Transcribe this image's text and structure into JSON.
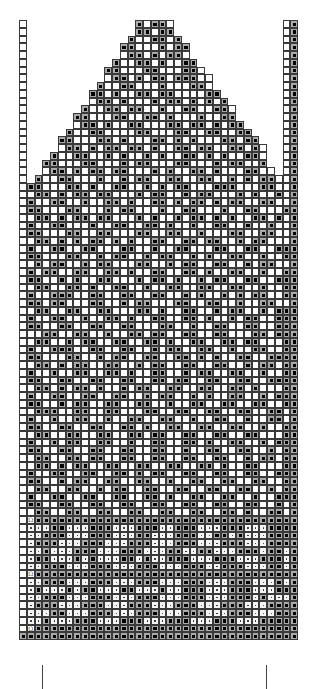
{
  "chart_title": "",
  "legend": {
    "w": "knit stitch (empty)",
    "g": "contrast colour stitch",
    "d": "purl / dot stitch",
    "q": "twisted stitch",
    ".": "no stitch"
  },
  "twist_symbol": "Ω",
  "columns": 36,
  "rows": [
    "w..............gwggw..............wg",
    "w..............ggwgg..............wg",
    "w.............gwwggwg.............wg",
    "w............ggwwwgwgg............wg",
    "w............wggwgwggw............wg",
    "w...........gwwggwgwwgg...........wg",
    "w..........ggwwwggwwwggw..........wg",
    "w..........wggwgwggwgggww.........wg",
    "w.........gwwggwwwgwwwggw.........wg",
    "w........ggwgwwggwggwwwwgg........wg",
    "w........wggwgwwwgwggwgwgwg.......wg",
    "w.......gwwggwggwwgwwggwwggw......wg",
    "w......ggwwwggwwggwgwwwgwwgg......wg",
    "w......wggwgwwggwwwggwggwgwgg.....wg",
    "w.....gwwggwwwwggwwwggwwggwwgg....wg",
    "w....ggwwwggwgwwwggwgwgwwwggwgg...wg",
    "w....wggwgwggwggwgwwggwggwwggwgw..wg",
    "w...gwwggwwgwgwwgwgwwggwgwgwwggw..wg",
    "w..ggwwwggwwwgwggwwwggwwwgwggwwg..wg",
    "w..wggwgwggwggwwwgwgwwggwgwwwggww.wg",
    "w.gwwggwwwgwwgwggwwggwwggwwgwgwggwwg",
    "wggwwwggwgwwggwwgwgwggwwwgggwwwggwwg",
    "wwggwgwggwggwwwgwggwwgwggwwwgwgwwgwg",
    "wgwwggwwgwwggwgwwggwgwggwgwggwwggwwg",
    "wggwwwggwwwgwggwwwgwwggwwwgwwggwwwgg",
    "wwggwgwggwggwwwgwgwwgwggwgwgwwggwgwg",
    "wgwwggwwwgwwggwwggwgwwgwwggwwgwwgwwg",
    "wggwwwggwwggwwwggwwggwwgwwwggwwggwwg",
    "wwggwgwgwggwgwgwwggwwggwggwwgwggwwwg",
    "wgwwggwwggwwwggwwgwwggwwwggwwggwwggg",
    "wggwwwggwwgwggwwgwggwwgwgwwggwwgwwgg",
    "wwgwggwwgwggwwwggwwgwggwwggwwgwggwwg",
    "wgwggwwggwwggwgwwggwwggwgwwggwwgwwgg",
    "wggwwgwgwwggwwwgwggwgwwgwggwwggwwggg",
    "wwggwwggwgwwggwwgwwggwwggwwggwwgwwgg",
    "wgwwgggwwggwwggwwggwwgwgwwgwgwggwwgg",
    "wggwggwwwggwwgwggwwwggwwggwwgwwggwwg",
    "wwggwwggwwggwwwggwgwwggwwgwggwwgwggg",
    "wgwwggwwgwwggwgwwggwwggwgwwgwggwwggg",
    "wggwwggwwggwwggwwwggwwgwwggwwggwwggg",
    "wwwggwwggwwgwwggwggwwggwwggwwwggwggg",
    "wwggwwgwggwwggwwggwgwwggwwggwggwwwgg",
    "wgwwgggwwggwwggwwgwggwwggwwgwwggwwgg",
    "wggwwwggwwgwggwwggwwggwgwgwwggwwgggg",
    "wwggwgwggwwggwwgwggwwggwwggwwgwggwgg",
    "wgwwgwwggwwggwgwwggwwgwggwwggwwgwwgg",
    "wggwwggwwggwwggwwggwggwwggwwggwwgggg",
    "wwggwgwggwgwwgwggwwggwwggwwggwgwwwgg",
    "wgwwggwwggwwggwwgwggwwgwgwwggwwgwggg",
    "wggwwgwggwwggwwggwwgwwggwwggwwggwwgg",
    "wwgggwwggwwggwwwggwwggwwggwwggwwggwg",
    "wgwwgwwggwwgwwggwwggwwgwwggwwgwwggwg",
    "wggwwggwwggwwggwgwwggwwggwwggwwgwwgg",
    "wwggwwggwwggwwggwggwwggwwggwwggwwwgg",
    "wgwwgwggwwggwwgwwggwwggwgwwggwwgwggg",
    "wggwwggwwggwwggwwggwwgwwggwwggwwgwgg",
    "wwggwwggwggwwggwwggwwggwwggwwgwggwgg",
    "wwggwgwggwwggwwggwwggwwggwgwwggwwwgg",
    "wgwwggwwggwwggwgwggwwggwwggwwggwwggg",
    "wggwwgwggwwggwwggwwgwwggwwggwwggwwgg",
    "wwggwwggwwgwggwwggwwggwwggwwggwwgwgg",
    "wgwwggwwggwwggwwggwgwwggwwggwwgwwggg",
    "wggwwggwwggwwggwwggwwggwwggwwggwwgwg",
    "wwggwwggwwggwwggwwggwwggwwggwgwwggwg",
    "wqgggggggggggggggggggggggggggggggggg",
    "wdddggdddgggdddgggddgggdddgggdddgggg",
    "wddgggdddgggdddggdddgggddggdgdddgggg",
    "wdgggdddgggdddgggdddgggdddgggdddgggg",
    "wddgdddgggdddgggdddggddggdddgggdggdg",
    "wdggdddgdgdddggdgddgggdddgggdddgggdg",
    "wddgggdddgggdddgggdddgggddgggdddggdg",
    "wqgggggggggggggggggggggggggggggggggg",
    "wddgggdddgggdddgggdddgggdddgggdddgdg",
    "wdgdddgdggdddggdddgddgggdddgggdddggg",
    "wddgggdddgggdddgggdddgggdddgggdgdddg",
    "wdgggdddgggdddgggdddgggdddgggdddgggg",
    "wdddggdddgggdddgggdddgggdddgggdddggg",
    "wddgdddgggdddgggdddgggdddgggdddggggg",
    "wqgggggggggggggggggggggggggggggggggg",
    "ggggggggggggggggggggggggggggggggggggg"
  ],
  "markers": [
    {
      "label": "",
      "column": 3
    },
    {
      "label": "",
      "column": 32
    }
  ]
}
